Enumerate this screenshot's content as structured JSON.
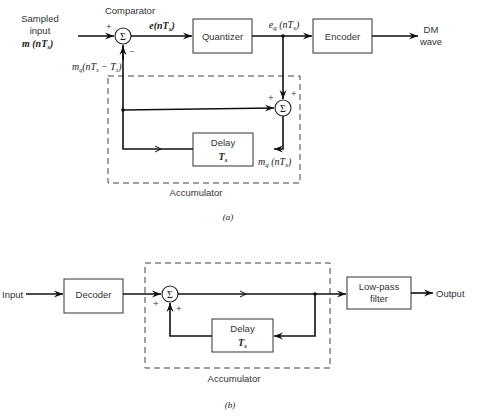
{
  "diagram_a": {
    "caption": "(a)",
    "input_label_line1": "Sampled",
    "input_label_line2": "input",
    "input_signal": "m (nT",
    "input_signal_sub": "s",
    "input_signal_close": ")",
    "comparator_label": "Comparator",
    "comparator_symbol": "Σ",
    "comparator_plus": "+",
    "comparator_minus": "−",
    "error_signal": "e(nT",
    "error_signal_sub": "s",
    "error_signal_close": ")",
    "quantizer_label": "Quantizer",
    "quantized_signal": "e",
    "quantized_signal_sub": "q",
    "quantized_signal_rest": " (nT",
    "quantized_signal_sub2": "s",
    "quantized_signal_close": ")",
    "encoder_label": "Encoder",
    "output_label_line1": "DM",
    "output_label_line2": "wave",
    "feedback_signal": "m",
    "feedback_signal_sub": "q",
    "feedback_signal_rest": "(nT",
    "feedback_signal_sub2": "s",
    "feedback_signal_rest2": " − T",
    "feedback_signal_sub3": "s",
    "feedback_signal_close": ")",
    "accumulator_sum_symbol": "Σ",
    "accumulator_plus_left": "+",
    "accumulator_plus_right": "+",
    "delay_label": "Delay",
    "delay_value": "T",
    "delay_value_sub": "s",
    "accum_output_signal": "m",
    "accum_output_signal_sub": "q",
    "accum_output_signal_rest": " (nT",
    "accum_output_signal_sub2": "s",
    "accum_output_signal_close": ")",
    "accumulator_label": "Accumulator"
  },
  "diagram_b": {
    "caption": "(b)",
    "input_label": "Input",
    "decoder_label": "Decoder",
    "sum_symbol": "Σ",
    "sum_plus_left": "+",
    "sum_plus_bottom": "+",
    "delay_label": "Delay",
    "delay_value": "T",
    "delay_value_sub": "s",
    "accumulator_label": "Accumulator",
    "lpf_label_line1": "Low-pass",
    "lpf_label_line2": "filter",
    "output_label": "Output"
  }
}
